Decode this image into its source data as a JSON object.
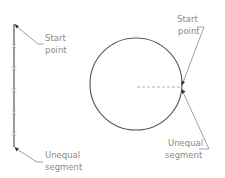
{
  "diagram": {
    "title": "",
    "colors": {
      "line": "#555555",
      "tick": "#b0b0b0",
      "dash": "#999999",
      "leader": "#777777",
      "text": "#8a8a8a"
    },
    "left_figure": {
      "type": "divided-line",
      "labels": {
        "start": [
          "Start",
          "point"
        ],
        "end": [
          "Unequal",
          "segment"
        ]
      }
    },
    "right_figure": {
      "type": "divided-circle",
      "labels": {
        "start": [
          "Start",
          "point"
        ],
        "end": [
          "Unequal",
          "segment"
        ]
      }
    }
  }
}
